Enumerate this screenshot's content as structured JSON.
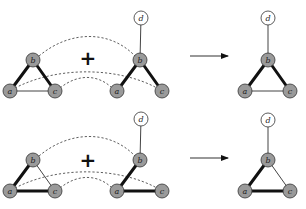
{
  "diagram": {
    "colors": {
      "filled_node": "#9a9a9a",
      "empty_node": "#ffffff",
      "node_stroke": "#333333",
      "edge": "#111111",
      "thin_edge": "#444444",
      "dashed": "#333333"
    },
    "plus_symbol": "+",
    "rows": [
      {
        "id": "top",
        "left_graph": {
          "nodes": [
            {
              "id": "a",
              "label": "a",
              "x": 10,
              "y": 91,
              "filled": true
            },
            {
              "id": "b",
              "label": "b",
              "x": 33,
              "y": 60,
              "filled": true
            },
            {
              "id": "c",
              "label": "c",
              "x": 55,
              "y": 91,
              "filled": true
            }
          ],
          "edges": [
            {
              "from": "a",
              "to": "b",
              "weight": "thick"
            },
            {
              "from": "b",
              "to": "c",
              "weight": "thick"
            },
            {
              "from": "a",
              "to": "c",
              "weight": "thin"
            }
          ]
        },
        "plus": {
          "x": 88,
          "y": 58
        },
        "middle_graph": {
          "nodes": [
            {
              "id": "d",
              "label": "d",
              "x": 141,
              "y": 18,
              "filled": false
            },
            {
              "id": "b",
              "label": "b",
              "x": 140,
              "y": 60,
              "filled": true
            },
            {
              "id": "a",
              "label": "a",
              "x": 117,
              "y": 91,
              "filled": true
            },
            {
              "id": "c",
              "label": "c",
              "x": 162,
              "y": 91,
              "filled": true
            }
          ],
          "edges": [
            {
              "from": "b",
              "to": "d",
              "weight": "thin"
            },
            {
              "from": "a",
              "to": "b",
              "weight": "thick"
            },
            {
              "from": "b",
              "to": "c",
              "weight": "thick"
            }
          ]
        },
        "dashed_links": [
          {
            "from": "left.b",
            "to": "middle.b",
            "path": "M 39 56 C 70 30, 110 30, 135 56"
          },
          {
            "from": "left.a",
            "to": "middle.c",
            "path": "M 15 88 C 60 65, 120 68, 157 88"
          },
          {
            "from": "left.c",
            "to": "middle.a",
            "path": "M 60 88 C 80 72, 100 76, 112 88"
          }
        ],
        "arrow": {
          "x1": 190,
          "y1": 56,
          "x2": 228,
          "y2": 56
        },
        "result_graph": {
          "nodes": [
            {
              "id": "d",
              "label": "d",
              "x": 268,
              "y": 18,
              "filled": false
            },
            {
              "id": "b",
              "label": "b",
              "x": 268,
              "y": 60,
              "filled": true
            },
            {
              "id": "a",
              "label": "a",
              "x": 245,
              "y": 91,
              "filled": true
            },
            {
              "id": "c",
              "label": "c",
              "x": 290,
              "y": 91,
              "filled": true
            }
          ],
          "edges": [
            {
              "from": "b",
              "to": "d",
              "weight": "thin"
            },
            {
              "from": "a",
              "to": "b",
              "weight": "thick"
            },
            {
              "from": "b",
              "to": "c",
              "weight": "thick"
            },
            {
              "from": "a",
              "to": "c",
              "weight": "thin"
            }
          ]
        }
      },
      {
        "id": "bottom",
        "left_graph": {
          "nodes": [
            {
              "id": "a",
              "label": "a",
              "x": 10,
              "y": 191,
              "filled": true
            },
            {
              "id": "b",
              "label": "b",
              "x": 33,
              "y": 160,
              "filled": true
            },
            {
              "id": "c",
              "label": "c",
              "x": 55,
              "y": 191,
              "filled": true
            }
          ],
          "edges": [
            {
              "from": "a",
              "to": "b",
              "weight": "thick"
            },
            {
              "from": "b",
              "to": "c",
              "weight": "thin"
            },
            {
              "from": "a",
              "to": "c",
              "weight": "thick"
            }
          ]
        },
        "plus": {
          "x": 88,
          "y": 160
        },
        "middle_graph": {
          "nodes": [
            {
              "id": "d",
              "label": "d",
              "x": 141,
              "y": 119,
              "filled": false
            },
            {
              "id": "b",
              "label": "b",
              "x": 140,
              "y": 160,
              "filled": true
            },
            {
              "id": "a",
              "label": "a",
              "x": 117,
              "y": 191,
              "filled": true
            },
            {
              "id": "c",
              "label": "c",
              "x": 162,
              "y": 191,
              "filled": true
            }
          ],
          "edges": [
            {
              "from": "b",
              "to": "d",
              "weight": "thin"
            },
            {
              "from": "a",
              "to": "b",
              "weight": "thick"
            },
            {
              "from": "a",
              "to": "c",
              "weight": "thick"
            }
          ]
        },
        "dashed_links": [
          {
            "from": "left.b",
            "to": "middle.b",
            "path": "M 39 156 C 70 130, 110 130, 135 156"
          },
          {
            "from": "left.a",
            "to": "middle.c",
            "path": "M 15 188 C 60 165, 120 168, 157 188"
          },
          {
            "from": "left.c",
            "to": "middle.a",
            "path": "M 60 188 C 80 172, 100 176, 112 188"
          }
        ],
        "arrow": {
          "x1": 190,
          "y1": 158,
          "x2": 228,
          "y2": 158
        },
        "result_graph": {
          "nodes": [
            {
              "id": "d",
              "label": "d",
              "x": 268,
              "y": 120,
              "filled": false
            },
            {
              "id": "b",
              "label": "b",
              "x": 268,
              "y": 160,
              "filled": true
            },
            {
              "id": "a",
              "label": "a",
              "x": 245,
              "y": 191,
              "filled": true
            },
            {
              "id": "c",
              "label": "c",
              "x": 290,
              "y": 191,
              "filled": true
            }
          ],
          "edges": [
            {
              "from": "b",
              "to": "d",
              "weight": "thin"
            },
            {
              "from": "a",
              "to": "b",
              "weight": "thick"
            },
            {
              "from": "a",
              "to": "c",
              "weight": "thick"
            },
            {
              "from": "b",
              "to": "c",
              "weight": "thin"
            }
          ]
        }
      }
    ]
  }
}
